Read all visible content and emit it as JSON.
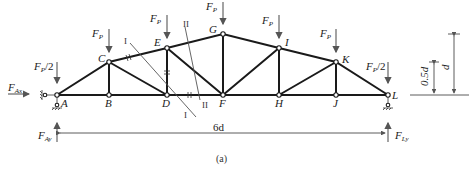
{
  "figure": {
    "caption": "(a)",
    "nodes": [
      {
        "id": "A",
        "label": "A"
      },
      {
        "id": "B",
        "label": "B"
      },
      {
        "id": "C",
        "label": "C"
      },
      {
        "id": "D",
        "label": "D"
      },
      {
        "id": "E",
        "label": "E"
      },
      {
        "id": "F",
        "label": "F"
      },
      {
        "id": "G",
        "label": "G"
      },
      {
        "id": "H",
        "label": "H"
      },
      {
        "id": "I",
        "label": "I"
      },
      {
        "id": "J",
        "label": "J"
      },
      {
        "id": "K",
        "label": "K"
      },
      {
        "id": "L",
        "label": "L"
      }
    ],
    "loads": {
      "end_main": "F",
      "end_sub": "P",
      "end_suffix": "/2",
      "mid_main": "F",
      "mid_sub": "P"
    },
    "reactions": {
      "fax_main": "F",
      "fax_sub": "Ax",
      "fay_main": "F",
      "fay_sub": "Ay",
      "fly_main": "F",
      "fly_sub": "Ly"
    },
    "dimensions": {
      "span": "6d",
      "height_full": "d",
      "height_half": "0.5d"
    },
    "sections": {
      "cut1": "I",
      "cut2": "II"
    }
  }
}
